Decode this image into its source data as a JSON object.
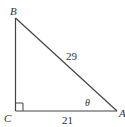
{
  "diagram": {
    "type": "right-triangle",
    "vertices": {
      "B": {
        "label": "B"
      },
      "C": {
        "label": "C"
      },
      "A": {
        "label": "A"
      }
    },
    "sides": {
      "hypotenuse": {
        "label": "29",
        "between": [
          "B",
          "A"
        ]
      },
      "base": {
        "label": "21",
        "between": [
          "C",
          "A"
        ]
      }
    },
    "angle": {
      "label": "θ",
      "at": "A"
    },
    "right_angle_at": "C",
    "colors": {
      "stroke": "#444444",
      "text": "#333333"
    }
  }
}
